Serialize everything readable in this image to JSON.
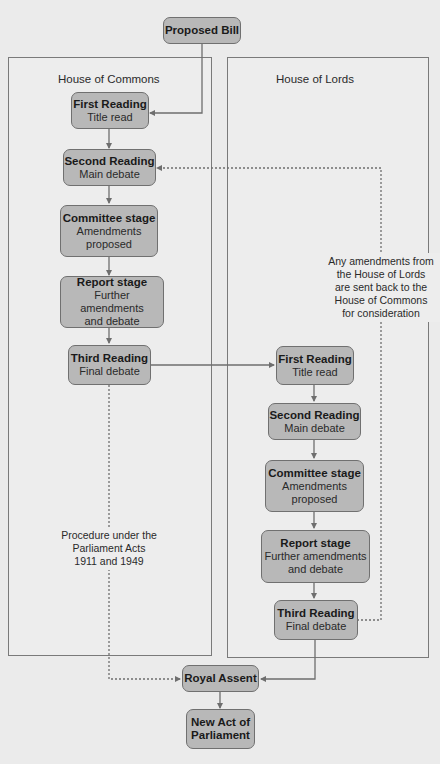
{
  "diagram": {
    "type": "flowchart",
    "start": {
      "title": "Proposed Bill"
    },
    "houses": [
      {
        "label": "House of Commons",
        "stages": [
          {
            "title": "First Reading",
            "subtitle": "Title read"
          },
          {
            "title": "Second Reading",
            "subtitle": "Main debate"
          },
          {
            "title": "Committee stage",
            "subtitle_lines": [
              "Amendments",
              "proposed"
            ]
          },
          {
            "title": "Report stage",
            "subtitle_lines": [
              "Further amendments",
              "and debate"
            ]
          },
          {
            "title": "Third Reading",
            "subtitle": "Final debate"
          }
        ]
      },
      {
        "label": "House of Lords",
        "stages": [
          {
            "title": "First Reading",
            "subtitle": "Title read"
          },
          {
            "title": "Second Reading",
            "subtitle": "Main debate"
          },
          {
            "title": "Committee stage",
            "subtitle_lines": [
              "Amendments",
              "proposed"
            ]
          },
          {
            "title": "Report stage",
            "subtitle_lines": [
              "Further amendments",
              "and debate"
            ]
          },
          {
            "title": "Third Reading",
            "subtitle": "Final debate"
          }
        ]
      }
    ],
    "royal_assent": {
      "title": "Royal Assent"
    },
    "end": {
      "title_lines": [
        "New Act of",
        "Parliament"
      ]
    },
    "notes": {
      "parliament_acts": [
        "Procedure under the",
        "Parliament Acts",
        "1911 and 1949"
      ],
      "lords_amendments": [
        "Any amendments from",
        "the House of Lords",
        "are sent back to the",
        "House of Commons",
        "for consideration"
      ]
    },
    "colors": {
      "background": "#ebebeb",
      "node_fill": "#b8b8b8",
      "node_border": "#707070",
      "line": "#6e6e6e"
    }
  }
}
